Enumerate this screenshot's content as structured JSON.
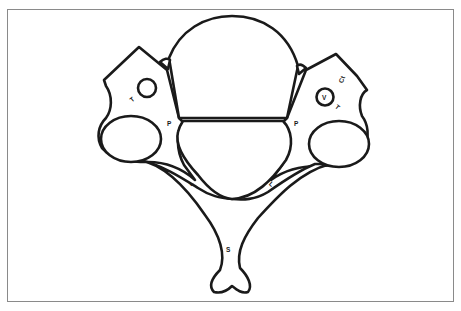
{
  "figure": {
    "type": "line-drawing"
  },
  "labels": {
    "left_t": "T",
    "left_p": "P",
    "left_l": "L",
    "right_p": "P",
    "right_l": "L",
    "right_v": "V",
    "right_t": "T",
    "right_ct": "Ct",
    "spinous_s": "S"
  },
  "label_notes": {
    "right_ct": "reading uncertain; glyph is small and rotated"
  },
  "colors": {
    "stroke": "#1a1a1a",
    "fill": "#ffffff",
    "frame": "#8a8a8a"
  }
}
